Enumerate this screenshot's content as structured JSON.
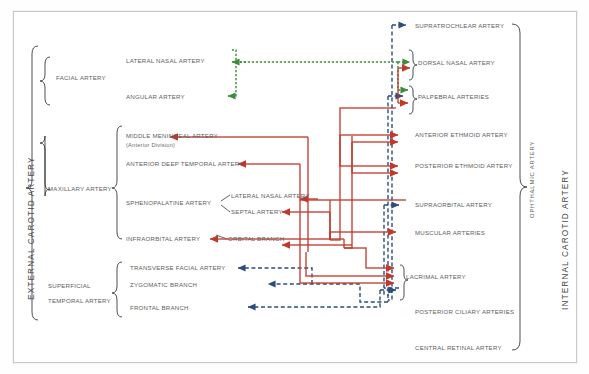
{
  "diagram": {
    "left_system_label": "EXTERNAL CAROTID ARTERY",
    "right_system_label": "INTERNAL CAROTID ARTERY",
    "right_sub_label": "OPHTHALMIC ARTERY",
    "right_sub_separator": "–"
  },
  "external_groups": [
    {
      "name": "FACIAL ARTERY",
      "branches": [
        {
          "label": "LATERAL NASAL ARTERY"
        },
        {
          "label": "ANGULAR ARTERY"
        }
      ]
    },
    {
      "name_line1": "MAXILLARY ARTERY",
      "branches": [
        {
          "label": "MIDDLE MENINGEAL ARTERY",
          "note": "(Anterior Division)"
        },
        {
          "label": "ANTERIOR DEEP TEMPORAL ARTERY"
        },
        {
          "label": "SPHENOPALATINE ARTERY",
          "sub": [
            {
              "label": "LATERAL NASAL ARTERY"
            },
            {
              "label": "SEPTAL ARTERY"
            }
          ]
        },
        {
          "label": "INFRAORBITAL ARTERY",
          "sub": [
            {
              "label": "ORBITAL BRANCH"
            }
          ]
        }
      ]
    },
    {
      "name_line1": "SUPERFICIAL",
      "name_line2": "TEMPORAL ARTERY",
      "branches": [
        {
          "label": "TRANSVERSE FACIAL ARTERY"
        },
        {
          "label": "ZYGOMATIC BRANCH"
        },
        {
          "label": "FRONTAL BRANCH"
        }
      ]
    }
  ],
  "ophthalmic_branches": [
    {
      "label": "SUPRATROCHLEAR ARTERY"
    },
    {
      "label": "DORSAL NASAL ARTERY"
    },
    {
      "label": "PALPEBRAL ARTERIES"
    },
    {
      "label": "ANTERIOR ETHMOID ARTERY"
    },
    {
      "label": "POSTERIOR ETHMOID ARTERY"
    },
    {
      "label": "SUPRAORBITAL ARTERY"
    },
    {
      "label": "MUSCULAR ARTERIES"
    },
    {
      "label": "LACRIMAL ARTERY"
    },
    {
      "label": "POSTERIOR CILIARY ARTERIES"
    },
    {
      "label": "CENTRAL RETINAL ARTERY"
    }
  ],
  "flow_colors": {
    "external_to_internal": "#c0392b",
    "bidirectional": "#3d8b3d",
    "internal_to_external": "#2b4d7e"
  }
}
